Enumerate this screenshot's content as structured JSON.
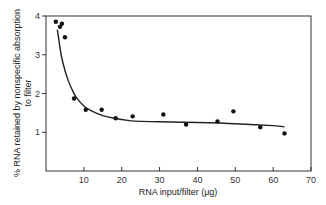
{
  "chart_data": {
    "type": "scatter",
    "title": "",
    "xlabel": "RNA input/filter (μg)",
    "ylabel_line1": "% RNA retained by nonspecific absorption",
    "ylabel_line2": "to filter",
    "xlim": [
      0,
      70
    ],
    "ylim": [
      0,
      4
    ],
    "xticks": [
      10,
      20,
      30,
      40,
      50,
      60,
      70
    ],
    "yticks": [
      1,
      2,
      3,
      4
    ],
    "grid": false,
    "legend": null,
    "series": [
      {
        "name": "measured",
        "kind": "points",
        "x": [
          2.6,
          3.7,
          4.2,
          5.0,
          7.4,
          10.5,
          14.7,
          18.4,
          22.9,
          31.0,
          37.0,
          45.3,
          49.5,
          56.6,
          63.0
        ],
        "y": [
          3.85,
          3.72,
          3.8,
          3.45,
          1.87,
          1.58,
          1.58,
          1.36,
          1.41,
          1.46,
          1.2,
          1.28,
          1.54,
          1.13,
          0.97
        ]
      },
      {
        "name": "fitted curve",
        "kind": "line",
        "x": [
          3,
          4,
          5,
          6,
          7,
          8,
          10,
          12,
          15,
          18,
          22,
          25,
          30,
          40,
          50,
          60,
          63
        ],
        "y": [
          3.65,
          3.0,
          2.6,
          2.3,
          2.08,
          1.9,
          1.68,
          1.55,
          1.43,
          1.36,
          1.3,
          1.28,
          1.27,
          1.25,
          1.22,
          1.17,
          1.14
        ]
      }
    ]
  }
}
